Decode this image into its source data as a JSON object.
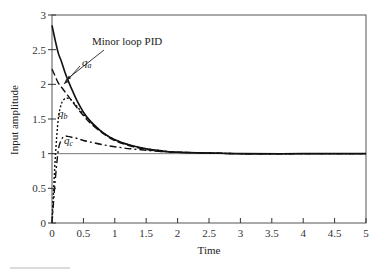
{
  "chart_data": {
    "type": "line",
    "title": "",
    "xlabel": "Time",
    "ylabel": "Input amplitude",
    "xlim": [
      0,
      5
    ],
    "ylim": [
      0,
      3
    ],
    "grid": false,
    "xticks": [
      "0",
      "0.5",
      "1",
      "1.5",
      "2",
      "2.5",
      "3",
      "3.5",
      "4",
      "4.5",
      "5"
    ],
    "yticks": [
      "0",
      "0.5",
      "1",
      "1.5",
      "2",
      "2.5",
      "3"
    ],
    "reference_line": {
      "y": 1
    },
    "annotations": [
      {
        "text": "Minor loop PID",
        "target_series": "Minor loop PID"
      },
      {
        "text": "q_a",
        "target_series": "q_a"
      },
      {
        "text": "q_b",
        "target_series": "q_b"
      },
      {
        "text": "q_c",
        "target_series": "q_c"
      }
    ],
    "x": [
      0,
      0.05,
      0.1,
      0.15,
      0.2,
      0.25,
      0.3,
      0.4,
      0.5,
      0.6,
      0.8,
      1.0,
      1.25,
      1.5,
      1.75,
      2.0,
      2.5,
      3.0,
      4.0,
      5.0
    ],
    "series": [
      {
        "name": "Minor loop PID",
        "style": "solid",
        "values": [
          2.85,
          2.64,
          2.45,
          2.33,
          2.19,
          2.07,
          1.96,
          1.76,
          1.6,
          1.48,
          1.31,
          1.2,
          1.12,
          1.07,
          1.04,
          1.02,
          1.01,
          1.0,
          1.0,
          1.0
        ]
      },
      {
        "name": "q_a",
        "style": "dashed",
        "values": [
          2.22,
          2.12,
          2.02,
          1.96,
          1.9,
          1.84,
          1.78,
          1.66,
          1.55,
          1.45,
          1.3,
          1.19,
          1.11,
          1.06,
          1.03,
          1.02,
          1.01,
          1.0,
          1.0,
          1.0
        ]
      },
      {
        "name": "q_b",
        "style": "dotted",
        "values": [
          0.0,
          0.9,
          1.5,
          1.72,
          1.79,
          1.8,
          1.78,
          1.68,
          1.57,
          1.47,
          1.31,
          1.2,
          1.12,
          1.07,
          1.04,
          1.02,
          1.01,
          1.0,
          1.0,
          1.0
        ]
      },
      {
        "name": "q_c",
        "style": "dash-dot",
        "values": [
          0.0,
          0.6,
          1.05,
          1.2,
          1.25,
          1.25,
          1.24,
          1.22,
          1.19,
          1.17,
          1.13,
          1.1,
          1.07,
          1.05,
          1.03,
          1.02,
          1.01,
          1.0,
          1.0,
          1.0
        ]
      }
    ]
  }
}
